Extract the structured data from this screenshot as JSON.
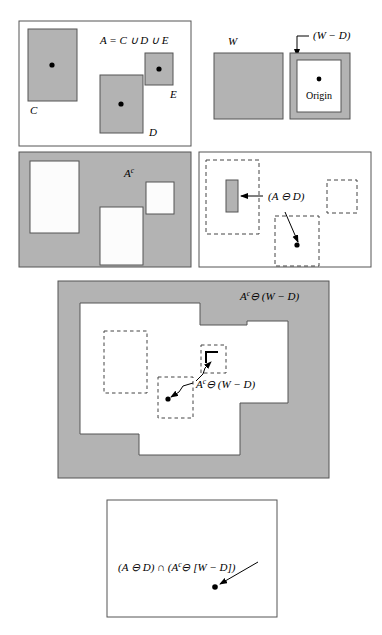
{
  "figure": {
    "colors": {
      "set_fill": "#b3b3b3",
      "background": "#ffffff",
      "stroke": "#555555",
      "ink": "#000000"
    }
  },
  "panels": [
    {
      "id": "panel-a",
      "name": "set-A-panel",
      "caption": "A = C ∪ D ∪ E",
      "frame": {
        "x": 19,
        "y": 21,
        "w": 172,
        "h": 125
      },
      "shapes": [
        {
          "name": "rect-C",
          "label": "C",
          "x": 28,
          "y": 29,
          "w": 49,
          "h": 72,
          "fill": "#b3b3b3",
          "dot": {
            "x": 52,
            "y": 65
          },
          "label_x": 30,
          "label_y": 114
        },
        {
          "name": "rect-D",
          "label": "D",
          "x": 100,
          "y": 75,
          "w": 43,
          "h": 58,
          "fill": "#b3b3b3",
          "dot": {
            "x": 121,
            "y": 104
          },
          "label_x": 149,
          "label_y": 134
        },
        {
          "name": "rect-E",
          "label": "E",
          "x": 145,
          "y": 53,
          "w": 28,
          "h": 32,
          "fill": "#b3b3b3",
          "dot": {
            "x": 159,
            "y": 69
          },
          "label_x": 170,
          "label_y": 98
        }
      ],
      "caption_x": 100,
      "caption_y": 44
    },
    {
      "id": "panel-w",
      "name": "structuring-element-W-panel",
      "caption": "W",
      "caption_x": 228,
      "caption_y": 44,
      "square": {
        "x": 214,
        "y": 53,
        "w": 69,
        "h": 66,
        "fill": "#b3b3b3"
      }
    },
    {
      "id": "panel-wd",
      "name": "window-minus-D-panel",
      "caption": "(W − D)",
      "caption_x": 313,
      "caption_y": 39,
      "origin_label": "Origin",
      "outer": {
        "x": 290,
        "y": 53,
        "w": 60,
        "h": 66,
        "fill": "#b3b3b3"
      },
      "inner": {
        "x": 297,
        "y": 60,
        "w": 44,
        "h": 52,
        "fill": "#ffffff"
      },
      "dot": {
        "x": 319,
        "y": 79
      },
      "origin_x": 319,
      "origin_y": 97,
      "arrow": {
        "x1": 297,
        "y1": 34,
        "x2": 293,
        "y2": 59
      }
    },
    {
      "id": "panel-ac",
      "name": "complement-of-A-panel",
      "caption": "A",
      "caption_sup": "c",
      "caption_x": 124,
      "caption_y": 177,
      "frame": {
        "x": 19,
        "y": 152,
        "w": 172,
        "h": 115,
        "fill": "#b3b3b3"
      },
      "holes": [
        {
          "name": "hole-C",
          "x": 30,
          "y": 161,
          "w": 49,
          "h": 72
        },
        {
          "name": "hole-E",
          "x": 146,
          "y": 182,
          "w": 28,
          "h": 32
        },
        {
          "name": "hole-D",
          "x": 100,
          "y": 207,
          "w": 43,
          "h": 58
        }
      ]
    },
    {
      "id": "panel-erosion-a",
      "name": "erosion-A-by-D-panel",
      "caption": "(A ⊖ D)",
      "caption_x": 270,
      "caption_y": 203,
      "frame": {
        "x": 199,
        "y": 152,
        "w": 172,
        "h": 115
      },
      "dashed": [
        {
          "name": "dashed-C",
          "x": 206,
          "y": 160,
          "w": 53,
          "h": 74
        },
        {
          "name": "dashed-E",
          "x": 327,
          "y": 180,
          "w": 30,
          "h": 33
        },
        {
          "name": "dashed-D",
          "x": 275,
          "y": 216,
          "w": 44,
          "h": 50
        }
      ],
      "erosion_rect": {
        "name": "erosion-of-C",
        "x": 226,
        "y": 180,
        "w": 12,
        "h": 32,
        "fill": "#b3b3b3"
      },
      "erosion_dot": {
        "name": "erosion-of-D",
        "x": 297,
        "y": 245
      },
      "arrow_to_rect": {
        "x1": 262,
        "y1": 196,
        "x2": 240,
        "y2": 196
      },
      "arrow_to_dot": {
        "x1": 285,
        "y1": 212,
        "x2": 299,
        "y2": 242
      }
    },
    {
      "id": "panel-erosion-ac",
      "name": "erosion-Ac-by-W-minus-D-panel",
      "caption": "A",
      "caption_sup": "c",
      "caption_rest": "⊖ (W − D)",
      "caption_x": 240,
      "caption_y": 300,
      "frame": {
        "x": 58,
        "y": 281,
        "w": 271,
        "h": 197,
        "fill": "#b3b3b3"
      },
      "inner_label": "A",
      "inner_label_sup": "c",
      "inner_label_rest": "⊖ (W − D)",
      "inner_label_x": 199,
      "inner_label_y": 388,
      "dashed": [
        {
          "name": "dashed-C-eroded",
          "x": 104,
          "y": 331,
          "w": 43,
          "h": 62
        },
        {
          "name": "dashed-E-eroded",
          "x": 201,
          "y": 345,
          "w": 25,
          "h": 28
        },
        {
          "name": "dashed-D-eroded",
          "x": 158,
          "y": 377,
          "w": 35,
          "h": 41
        }
      ],
      "corner_mark": {
        "name": "eroded-corner-glyph",
        "x": 205,
        "y": 351,
        "w": 14,
        "h": 13
      },
      "dot": {
        "x": 168,
        "y": 399
      },
      "arrow_corner": {
        "x1": 193,
        "y1": 382,
        "x2": 211,
        "y2": 360
      },
      "arrow_dot": {
        "x1": 190,
        "y1": 384,
        "x2": 170,
        "y2": 397
      }
    },
    {
      "id": "panel-result",
      "name": "hit-or-miss-result-panel",
      "caption": "(A ⊖ D) ∩ (A",
      "caption_sup": "c",
      "caption_rest": "⊖ [W − D])",
      "caption_x": 118,
      "caption_y": 570,
      "frame": {
        "x": 107,
        "y": 500,
        "w": 170,
        "h": 117
      },
      "dot": {
        "x": 215,
        "y": 587
      },
      "arrow": {
        "x1": 257,
        "y1": 563,
        "x2": 219,
        "y2": 585
      }
    }
  ],
  "symbols": {
    "union": "∪",
    "intersection": "∩",
    "erosion": "⊖",
    "minus": "−"
  }
}
